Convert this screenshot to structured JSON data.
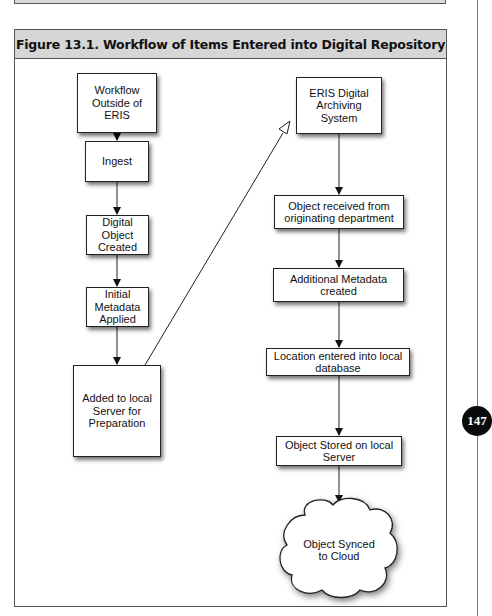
{
  "page": {
    "page_number": "147"
  },
  "figure": {
    "title": "Figure 13.1.  Workflow of Items Entered into Digital Repository",
    "left_column": [
      {
        "id": "workflow-outside",
        "label": "Workflow\nOutside of\nERIS"
      },
      {
        "id": "ingest",
        "label": "Ingest"
      },
      {
        "id": "digital-object-created",
        "label": "Digital\nObject\nCreated"
      },
      {
        "id": "initial-metadata",
        "label": "Initial\nMetadata\nApplied"
      },
      {
        "id": "added-local-server",
        "label": "Added to local\nServer for\nPreparation"
      }
    ],
    "right_column": [
      {
        "id": "eris-system",
        "label": "ERIS Digital\nArchiving\nSystem"
      },
      {
        "id": "object-received",
        "label": "Object received from\noriginating department"
      },
      {
        "id": "additional-metadata",
        "label": "Additional Metadata\ncreated"
      },
      {
        "id": "location-entered",
        "label": "Location entered into local\ndatabase"
      },
      {
        "id": "object-stored",
        "label": "Object Stored on local\nServer"
      },
      {
        "id": "object-synced",
        "label": "Object Synced\nto Cloud",
        "shape": "cloud"
      }
    ],
    "edges": [
      {
        "from": "workflow-outside",
        "to": "ingest"
      },
      {
        "from": "ingest",
        "to": "digital-object-created"
      },
      {
        "from": "digital-object-created",
        "to": "initial-metadata"
      },
      {
        "from": "initial-metadata",
        "to": "added-local-server"
      },
      {
        "from": "added-local-server",
        "to": "eris-system",
        "style": "open-arrow"
      },
      {
        "from": "eris-system",
        "to": "object-received"
      },
      {
        "from": "object-received",
        "to": "additional-metadata"
      },
      {
        "from": "additional-metadata",
        "to": "location-entered"
      },
      {
        "from": "location-entered",
        "to": "object-stored"
      },
      {
        "from": "object-stored",
        "to": "object-synced"
      }
    ]
  }
}
